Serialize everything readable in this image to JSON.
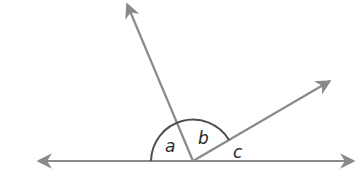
{
  "diagram": {
    "type": "angles on a straight line",
    "colors": {
      "line": "#8a8a8a",
      "arc": "#505050",
      "label": "#2a2a2a",
      "background": "#ffffff"
    },
    "vertex": {
      "x": 193,
      "y": 161
    },
    "rays": [
      {
        "name": "left-ray",
        "to": {
          "x": 36,
          "y": 161
        }
      },
      {
        "name": "right-ray",
        "to": {
          "x": 356,
          "y": 161
        }
      },
      {
        "name": "upper-ray",
        "to": {
          "x": 126,
          "y": 2
        }
      },
      {
        "name": "diagonal-ray",
        "to": {
          "x": 332,
          "y": 80
        }
      }
    ],
    "angle_labels": [
      {
        "id": "a",
        "text": "a"
      },
      {
        "id": "b",
        "text": "b"
      },
      {
        "id": "c",
        "text": "c"
      }
    ]
  }
}
